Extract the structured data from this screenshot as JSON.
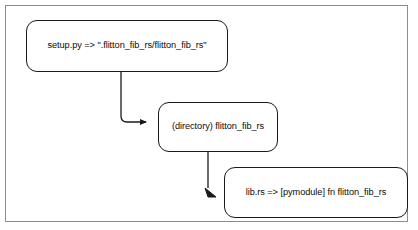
{
  "diagram": {
    "type": "flowchart",
    "orientation": "top-left-to-bottom-right cascade",
    "background_color": "#ffffff",
    "border_color": "#8d8d8d",
    "node_border_color": "#1a1a1a",
    "connector_color": "#1a1a1a",
    "nodes": [
      {
        "id": "setup-py",
        "label": "setup.py => \".flitton_fib_rs/flitton_fib_rs\"",
        "shape": "rounded-rectangle"
      },
      {
        "id": "directory",
        "label": "(directory) flitton_fib_rs",
        "shape": "rounded-rectangle"
      },
      {
        "id": "lib-rs",
        "label": "lib.rs => [pymodule] fn flitton_fib_rs",
        "shape": "rounded-rectangle"
      }
    ],
    "edges": [
      {
        "id": "setup-py-to-directory",
        "from": "setup-py",
        "to": "directory",
        "label": "",
        "style": "elbow-arrow",
        "arrowhead": "right"
      },
      {
        "id": "directory-to-lib-rs",
        "from": "directory",
        "to": "lib-rs",
        "label": "",
        "style": "elbow-arrow",
        "arrowhead": "down-right"
      }
    ]
  }
}
